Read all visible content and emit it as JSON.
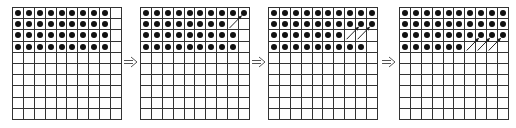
{
  "diagram": {
    "rows": 10,
    "cols": 10,
    "dot_color": "#111111",
    "line_color": "#333333",
    "grids": [
      {
        "left": 12,
        "filled": [
          [
            0,
            1,
            2,
            3,
            4,
            5,
            6,
            7,
            8
          ],
          [
            0,
            1,
            2,
            3,
            4,
            5,
            6,
            7,
            8
          ],
          [
            0,
            1,
            2,
            3,
            4,
            5,
            6,
            7,
            8
          ],
          [
            0,
            1,
            2,
            3,
            4,
            5,
            6,
            7,
            8
          ]
        ],
        "moves": []
      },
      {
        "left": 140,
        "filled": [
          [
            0,
            1,
            2,
            3,
            4,
            5,
            6,
            7,
            8,
            9
          ],
          [
            0,
            1,
            2,
            3,
            4,
            5,
            6,
            7
          ],
          [
            0,
            1,
            2,
            3,
            4,
            5,
            6,
            7,
            8
          ],
          [
            0,
            1,
            2,
            3,
            4,
            5,
            6,
            7,
            8
          ]
        ],
        "moves": [
          [
            1,
            8,
            0,
            9
          ]
        ]
      },
      {
        "left": 268,
        "filled": [
          [
            0,
            1,
            2,
            3,
            4,
            5,
            6,
            7,
            8,
            9
          ],
          [
            0,
            1,
            2,
            3,
            4,
            5,
            6,
            7,
            8,
            9
          ],
          [
            0,
            1,
            2,
            3,
            4,
            5,
            6
          ],
          [
            0,
            1,
            2,
            3,
            4,
            5,
            6,
            7,
            8
          ]
        ],
        "moves": [
          [
            2,
            7,
            1,
            8
          ],
          [
            2,
            8,
            1,
            9
          ]
        ]
      },
      {
        "left": 399,
        "filled": [
          [
            0,
            1,
            2,
            3,
            4,
            5,
            6,
            7,
            8,
            9
          ],
          [
            0,
            1,
            2,
            3,
            4,
            5,
            6,
            7,
            8,
            9
          ],
          [
            0,
            1,
            2,
            3,
            4,
            5,
            6,
            7,
            8,
            9
          ],
          [
            0,
            1,
            2,
            3,
            4,
            5
          ]
        ],
        "moves": [
          [
            3,
            6,
            2,
            7
          ],
          [
            3,
            7,
            2,
            8
          ],
          [
            3,
            8,
            2,
            9
          ]
        ]
      }
    ],
    "step_arrows": [
      {
        "left": 124,
        "icon": "double-arrow-right-icon"
      },
      {
        "left": 252,
        "icon": "double-arrow-right-icon"
      },
      {
        "left": 382,
        "icon": "double-arrow-right-icon"
      }
    ]
  }
}
